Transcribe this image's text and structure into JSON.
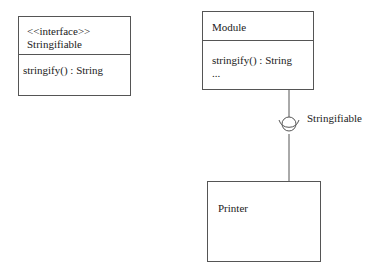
{
  "diagram": {
    "type": "UML class diagram",
    "interface_box": {
      "stereotype": "<<interface>>",
      "name": "Stringifiable",
      "operations": [
        "stringify() : String"
      ]
    },
    "module_box": {
      "name": "Module",
      "operations": [
        "stringify() : String",
        "..."
      ]
    },
    "printer_box": {
      "name": "Printer"
    },
    "connector": {
      "label": "Stringifiable",
      "provided_by": "Module",
      "required_by": "Printer",
      "notation": "ball-and-socket"
    },
    "colors": {
      "line": "#555555",
      "text": "#222222",
      "background": "#ffffff"
    }
  }
}
